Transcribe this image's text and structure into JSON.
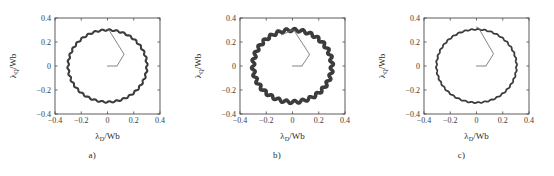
{
  "figure": {
    "panel_count": 3,
    "background_color": "#ffffff",
    "trace_color": "#3c3c3c",
    "transient_color": "#6e6e6e",
    "axis_color": "#4a4a4a"
  },
  "chart_data": [
    {
      "type": "line",
      "title": "",
      "subcaption": "a)",
      "xlabel": "λD/Wb",
      "xlabel_main": "λ",
      "xlabel_sub": "D",
      "xlabel_unit": "/Wb",
      "ylabel": "λQ/Wb",
      "ylabel_main": "λ",
      "ylabel_sub": "Q",
      "ylabel_unit": "/Wb",
      "xlim": [
        -0.4,
        0.4
      ],
      "ylim": [
        -0.4,
        0.4
      ],
      "xticks": [
        -0.4,
        -0.2,
        0,
        0.2,
        0.4
      ],
      "xtick_labels": [
        "-0.4",
        "-0.2",
        "0",
        "0.2",
        "0.4"
      ],
      "yticks": [
        -0.4,
        -0.2,
        0,
        0.2,
        0.4
      ],
      "ytick_labels": [
        "0.4",
        "0.2",
        "0",
        "-0.2",
        "-0.4"
      ],
      "grid": false,
      "legend": "none",
      "series": [
        {
          "name": "stator-flux-locus",
          "shape": "circle",
          "radius": 0.3,
          "center": [
            0.0,
            0.0
          ],
          "band_width_wb": 0.016,
          "ripple_amplitude_wb": 0.006,
          "ripple_cycles": 34,
          "stroke_width_px": 2.1
        },
        {
          "name": "startup-transient",
          "points": [
            [
              0.0,
              0.0
            ],
            [
              0.075,
              0.0
            ],
            [
              0.075,
              0.005
            ],
            [
              0.125,
              0.095
            ],
            [
              0.125,
              0.1
            ],
            [
              0.012,
              0.298
            ],
            [
              0.0,
              0.302
            ]
          ]
        }
      ]
    },
    {
      "type": "line",
      "title": "",
      "subcaption": "b)",
      "xlabel": "λD/Wb",
      "xlabel_main": "λ",
      "xlabel_sub": "D",
      "xlabel_unit": "/Wb",
      "ylabel": "λQ/Wb",
      "ylabel_main": "λ",
      "ylabel_sub": "Q",
      "ylabel_unit": "/Wb",
      "xlim": [
        -0.4,
        0.4
      ],
      "ylim": [
        -0.4,
        0.4
      ],
      "xticks": [
        -0.4,
        -0.2,
        0,
        0.2,
        0.4
      ],
      "xtick_labels": [
        "-0.4",
        "-0.2",
        "0",
        "0.2",
        "0.4"
      ],
      "yticks": [
        -0.4,
        -0.2,
        0,
        0.2,
        0.4
      ],
      "ytick_labels": [
        "0.4",
        "0.2",
        "0",
        "-0.2",
        "-0.4"
      ],
      "grid": false,
      "legend": "none",
      "series": [
        {
          "name": "stator-flux-locus",
          "shape": "circle",
          "radius": 0.3,
          "center": [
            0.0,
            0.0
          ],
          "band_width_wb": 0.03,
          "ripple_amplitude_wb": 0.012,
          "ripple_cycles": 30,
          "stroke_width_px": 3.6
        },
        {
          "name": "startup-transient",
          "points": [
            [
              0.0,
              0.0
            ],
            [
              0.075,
              0.0
            ],
            [
              0.075,
              0.005
            ],
            [
              0.128,
              0.092
            ],
            [
              0.128,
              0.1
            ],
            [
              0.02,
              0.282
            ],
            [
              0.0,
              0.3
            ],
            [
              -0.085,
              0.258
            ]
          ]
        }
      ]
    },
    {
      "type": "line",
      "title": "",
      "subcaption": "c)",
      "xlabel": "λD/Wb",
      "xlabel_main": "λ",
      "xlabel_sub": "D",
      "xlabel_unit": "/Wb",
      "ylabel": "λQ/Wb",
      "ylabel_main": "λ",
      "ylabel_sub": "Q",
      "ylabel_unit": "/Wb",
      "xlim": [
        -0.4,
        0.4
      ],
      "ylim": [
        -0.4,
        0.4
      ],
      "xticks": [
        -0.4,
        -0.2,
        0,
        0.2,
        0.4
      ],
      "xtick_labels": [
        "-0.4",
        "-0.2",
        "0",
        "0.2",
        "0.4"
      ],
      "yticks": [
        -0.4,
        -0.2,
        0,
        0.2,
        0.4
      ],
      "ytick_labels": [
        "0.4",
        "0.2",
        "0",
        "-0.2",
        "-0.4"
      ],
      "grid": false,
      "legend": "none",
      "series": [
        {
          "name": "stator-flux-locus",
          "shape": "circle",
          "radius": 0.305,
          "center": [
            0.0,
            0.0
          ],
          "band_width_wb": 0.013,
          "ripple_amplitude_wb": 0.004,
          "ripple_cycles": 38,
          "stroke_width_px": 1.8
        },
        {
          "name": "startup-transient",
          "points": [
            [
              0.0,
              0.0
            ],
            [
              0.075,
              0.0
            ],
            [
              0.075,
              0.005
            ],
            [
              0.128,
              0.098
            ],
            [
              0.128,
              0.105
            ],
            [
              0.015,
              0.318
            ],
            [
              0.0,
              0.325
            ]
          ]
        }
      ]
    }
  ]
}
